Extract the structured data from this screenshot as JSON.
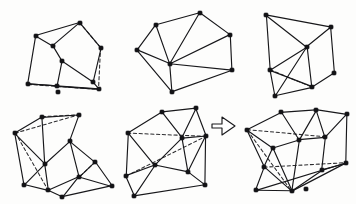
{
  "panel": {
    "title": "Polyhedral graph transformation figure",
    "background_color": "#fdfdfc",
    "ink_color": "#17171a",
    "width": 356,
    "height": 204,
    "style": "hand-drawn line drawing, filled vertex dots, dashed hidden edges"
  },
  "legend": {
    "vertex_style": "filled black square dot",
    "solid_edge_meaning": "visible edge",
    "dashed_edge_meaning": "hidden edge"
  },
  "arrow": {
    "name": "rightward-transformation-arrow",
    "glyph": "outlined block arrow pointing right",
    "x": 211,
    "y": 112,
    "width": 26,
    "height": 26,
    "fill": "#ffffff",
    "stroke": "#1a1a1d",
    "points": "212,124 222,124 222,117 235,126 222,135 222,128 212,128"
  },
  "figures": [
    {
      "id": "fig-top-left",
      "name": "cube-like-polyhedron",
      "vertex_count": 10,
      "vertices": [
        [
          36,
          36
        ],
        [
          53,
          46
        ],
        [
          80,
          23
        ],
        [
          101,
          48
        ],
        [
          93,
          82
        ],
        [
          62,
          61
        ],
        [
          28,
          84
        ],
        [
          58,
          92
        ],
        [
          57,
          86
        ],
        [
          99,
          89
        ]
      ],
      "solid_edges": [
        [
          [
            36,
            36
          ],
          [
            80,
            23
          ]
        ],
        [
          [
            36,
            36
          ],
          [
            53,
            46
          ]
        ],
        [
          [
            53,
            46
          ],
          [
            80,
            23
          ]
        ],
        [
          [
            80,
            23
          ],
          [
            101,
            48
          ]
        ],
        [
          [
            53,
            46
          ],
          [
            62,
            61
          ]
        ],
        [
          [
            62,
            61
          ],
          [
            93,
            82
          ]
        ],
        [
          [
            93,
            82
          ],
          [
            101,
            48
          ]
        ],
        [
          [
            36,
            36
          ],
          [
            28,
            84
          ]
        ],
        [
          [
            28,
            84
          ],
          [
            57,
            86
          ]
        ],
        [
          [
            57,
            86
          ],
          [
            62,
            61
          ]
        ],
        [
          [
            57,
            86
          ],
          [
            99,
            89
          ]
        ],
        [
          [
            99,
            89
          ],
          [
            93,
            82
          ]
        ],
        [
          [
            28,
            84
          ],
          [
            99,
            89
          ]
        ]
      ],
      "dashed_edges": [
        [
          [
            101,
            48
          ],
          [
            99,
            89
          ]
        ],
        [
          [
            28,
            84
          ],
          [
            99,
            89
          ]
        ],
        [
          [
            80,
            23
          ],
          [
            101,
            48
          ]
        ]
      ]
    },
    {
      "id": "fig-top-mid",
      "name": "triangulated-planar-graph",
      "vertex_count": 7,
      "vertices": [
        [
          156,
          25
        ],
        [
          200,
          13
        ],
        [
          230,
          35
        ],
        [
          137,
          50
        ],
        [
          170,
          64
        ],
        [
          232,
          70
        ],
        [
          172,
          92
        ]
      ],
      "solid_edges": [
        [
          [
            156,
            25
          ],
          [
            200,
            13
          ]
        ],
        [
          [
            200,
            13
          ],
          [
            230,
            35
          ]
        ],
        [
          [
            137,
            50
          ],
          [
            156,
            25
          ]
        ],
        [
          [
            156,
            25
          ],
          [
            170,
            64
          ]
        ],
        [
          [
            200,
            13
          ],
          [
            170,
            64
          ]
        ],
        [
          [
            230,
            35
          ],
          [
            170,
            64
          ]
        ],
        [
          [
            137,
            50
          ],
          [
            170,
            64
          ]
        ],
        [
          [
            170,
            64
          ],
          [
            172,
            92
          ]
        ],
        [
          [
            170,
            64
          ],
          [
            232,
            70
          ]
        ],
        [
          [
            230,
            35
          ],
          [
            232,
            70
          ]
        ],
        [
          [
            172,
            92
          ],
          [
            232,
            70
          ]
        ],
        [
          [
            137,
            50
          ],
          [
            172,
            92
          ]
        ]
      ],
      "dashed_edges": []
    },
    {
      "id": "fig-top-right",
      "name": "wheel-graph-with-hidden-edge",
      "vertex_count": 7,
      "vertices": [
        [
          266,
          15
        ],
        [
          331,
          27
        ],
        [
          307,
          47
        ],
        [
          270,
          70
        ],
        [
          334,
          73
        ],
        [
          312,
          87
        ],
        [
          275,
          96
        ]
      ],
      "solid_edges": [
        [
          [
            266,
            15
          ],
          [
            331,
            27
          ]
        ],
        [
          [
            266,
            15
          ],
          [
            307,
            47
          ]
        ],
        [
          [
            331,
            27
          ],
          [
            307,
            47
          ]
        ],
        [
          [
            266,
            15
          ],
          [
            270,
            70
          ]
        ],
        [
          [
            270,
            70
          ],
          [
            307,
            47
          ]
        ],
        [
          [
            307,
            47
          ],
          [
            312,
            87
          ]
        ],
        [
          [
            331,
            27
          ],
          [
            334,
            73
          ]
        ],
        [
          [
            334,
            73
          ],
          [
            312,
            87
          ]
        ],
        [
          [
            270,
            70
          ],
          [
            275,
            96
          ]
        ],
        [
          [
            275,
            96
          ],
          [
            312,
            87
          ]
        ],
        [
          [
            270,
            70
          ],
          [
            312,
            87
          ]
        ],
        [
          [
            275,
            96
          ],
          [
            307,
            47
          ]
        ]
      ],
      "dashed_edges": [
        [
          [
            270,
            70
          ],
          [
            312,
            87
          ]
        ]
      ]
    },
    {
      "id": "fig-bottom-left",
      "name": "split-polyhedron-two-cells",
      "vertex_count": 11,
      "vertices": [
        [
          15,
          133
        ],
        [
          42,
          117
        ],
        [
          79,
          115
        ],
        [
          70,
          141
        ],
        [
          24,
          185
        ],
        [
          45,
          164
        ],
        [
          48,
          190
        ],
        [
          79,
          177
        ],
        [
          62,
          197
        ],
        [
          95,
          162
        ],
        [
          112,
          186
        ]
      ],
      "solid_edges": [
        [
          [
            15,
            133
          ],
          [
            42,
            117
          ]
        ],
        [
          [
            42,
            117
          ],
          [
            79,
            115
          ]
        ],
        [
          [
            79,
            115
          ],
          [
            70,
            141
          ]
        ],
        [
          [
            15,
            133
          ],
          [
            45,
            164
          ]
        ],
        [
          [
            45,
            164
          ],
          [
            70,
            141
          ]
        ],
        [
          [
            15,
            133
          ],
          [
            24,
            185
          ]
        ],
        [
          [
            24,
            185
          ],
          [
            45,
            164
          ]
        ],
        [
          [
            24,
            185
          ],
          [
            48,
            190
          ]
        ],
        [
          [
            48,
            190
          ],
          [
            45,
            164
          ]
        ],
        [
          [
            70,
            141
          ],
          [
            79,
            177
          ]
        ],
        [
          [
            48,
            190
          ],
          [
            79,
            177
          ]
        ],
        [
          [
            79,
            177
          ],
          [
            62,
            197
          ]
        ],
        [
          [
            62,
            197
          ],
          [
            48,
            190
          ]
        ],
        [
          [
            79,
            177
          ],
          [
            95,
            162
          ]
        ],
        [
          [
            95,
            162
          ],
          [
            112,
            186
          ]
        ],
        [
          [
            79,
            177
          ],
          [
            112,
            186
          ]
        ],
        [
          [
            62,
            197
          ],
          [
            112,
            186
          ]
        ],
        [
          [
            70,
            141
          ],
          [
            95,
            162
          ]
        ],
        [
          [
            42,
            117
          ],
          [
            45,
            164
          ]
        ]
      ],
      "dashed_edges": [
        [
          [
            15,
            133
          ],
          [
            79,
            115
          ]
        ],
        [
          [
            42,
            117
          ],
          [
            79,
            115
          ]
        ],
        [
          [
            15,
            133
          ],
          [
            48,
            190
          ]
        ],
        [
          [
            95,
            162
          ],
          [
            79,
            177
          ]
        ]
      ]
    },
    {
      "id": "fig-bottom-mid",
      "name": "quadrilateral-mesh-polyhedron",
      "vertex_count": 10,
      "vertices": [
        [
          128,
          133
        ],
        [
          162,
          112
        ],
        [
          196,
          108
        ],
        [
          182,
          138
        ],
        [
          206,
          136
        ],
        [
          126,
          176
        ],
        [
          155,
          165
        ],
        [
          188,
          172
        ],
        [
          134,
          196
        ],
        [
          205,
          185
        ]
      ],
      "solid_edges": [
        [
          [
            128,
            133
          ],
          [
            162,
            112
          ]
        ],
        [
          [
            162,
            112
          ],
          [
            196,
            108
          ]
        ],
        [
          [
            162,
            112
          ],
          [
            182,
            138
          ]
        ],
        [
          [
            182,
            138
          ],
          [
            196,
            108
          ]
        ],
        [
          [
            182,
            138
          ],
          [
            206,
            136
          ]
        ],
        [
          [
            196,
            108
          ],
          [
            206,
            136
          ]
        ],
        [
          [
            128,
            133
          ],
          [
            126,
            176
          ]
        ],
        [
          [
            126,
            176
          ],
          [
            155,
            165
          ]
        ],
        [
          [
            155,
            165
          ],
          [
            182,
            138
          ]
        ],
        [
          [
            128,
            133
          ],
          [
            155,
            165
          ]
        ],
        [
          [
            126,
            176
          ],
          [
            134,
            196
          ]
        ],
        [
          [
            134,
            196
          ],
          [
            155,
            165
          ]
        ],
        [
          [
            155,
            165
          ],
          [
            188,
            172
          ]
        ],
        [
          [
            182,
            138
          ],
          [
            188,
            172
          ]
        ],
        [
          [
            188,
            172
          ],
          [
            206,
            136
          ]
        ],
        [
          [
            134,
            196
          ],
          [
            205,
            185
          ]
        ],
        [
          [
            205,
            185
          ],
          [
            188,
            172
          ]
        ],
        [
          [
            205,
            185
          ],
          [
            206,
            136
          ]
        ]
      ],
      "dashed_edges": [
        [
          [
            128,
            133
          ],
          [
            206,
            136
          ]
        ],
        [
          [
            126,
            176
          ],
          [
            206,
            136
          ]
        ]
      ]
    },
    {
      "id": "fig-bottom-right",
      "name": "merged-polyhedron-result",
      "vertex_count": 13,
      "vertices": [
        [
          247,
          130
        ],
        [
          281,
          112
        ],
        [
          316,
          110
        ],
        [
          299,
          140
        ],
        [
          325,
          137
        ],
        [
          347,
          114
        ],
        [
          264,
          167
        ],
        [
          292,
          191
        ],
        [
          322,
          170
        ],
        [
          256,
          190
        ],
        [
          346,
          163
        ],
        [
          306,
          189
        ],
        [
          273,
          148
        ]
      ],
      "solid_edges": [
        [
          [
            247,
            130
          ],
          [
            281,
            112
          ]
        ],
        [
          [
            281,
            112
          ],
          [
            316,
            110
          ]
        ],
        [
          [
            316,
            110
          ],
          [
            347,
            114
          ]
        ],
        [
          [
            281,
            112
          ],
          [
            299,
            140
          ]
        ],
        [
          [
            299,
            140
          ],
          [
            316,
            110
          ]
        ],
        [
          [
            299,
            140
          ],
          [
            325,
            137
          ]
        ],
        [
          [
            325,
            137
          ],
          [
            316,
            110
          ]
        ],
        [
          [
            325,
            137
          ],
          [
            347,
            114
          ]
        ],
        [
          [
            247,
            130
          ],
          [
            273,
            148
          ]
        ],
        [
          [
            273,
            148
          ],
          [
            299,
            140
          ]
        ],
        [
          [
            247,
            130
          ],
          [
            264,
            167
          ]
        ],
        [
          [
            264,
            167
          ],
          [
            273,
            148
          ]
        ],
        [
          [
            264,
            167
          ],
          [
            256,
            190
          ]
        ],
        [
          [
            256,
            190
          ],
          [
            292,
            191
          ]
        ],
        [
          [
            292,
            191
          ],
          [
            299,
            140
          ]
        ],
        [
          [
            292,
            191
          ],
          [
            322,
            170
          ]
        ],
        [
          [
            322,
            170
          ],
          [
            325,
            137
          ]
        ],
        [
          [
            322,
            170
          ],
          [
            346,
            163
          ]
        ],
        [
          [
            346,
            163
          ],
          [
            347,
            114
          ]
        ],
        [
          [
            292,
            191
          ],
          [
            346,
            163
          ]
        ],
        [
          [
            256,
            190
          ],
          [
            346,
            163
          ]
        ],
        [
          [
            264,
            167
          ],
          [
            292,
            191
          ]
        ],
        [
          [
            273,
            148
          ],
          [
            292,
            191
          ]
        ]
      ],
      "dashed_edges": [
        [
          [
            247,
            130
          ],
          [
            325,
            137
          ]
        ],
        [
          [
            247,
            130
          ],
          [
            292,
            191
          ]
        ],
        [
          [
            264,
            167
          ],
          [
            346,
            163
          ]
        ]
      ]
    }
  ]
}
